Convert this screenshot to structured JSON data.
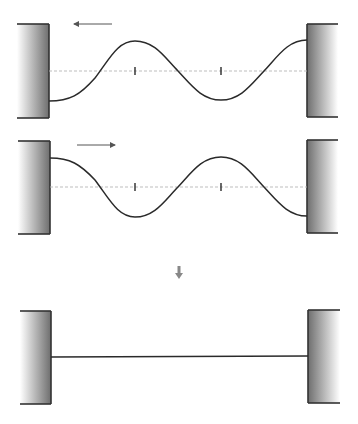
{
  "diagram": {
    "colors": {
      "wall_dark": "#6e6e6e",
      "wall_light": "#ffffff",
      "wall_border": "#333333",
      "wave": "#2a2a2a",
      "axis_dashed": "#b5b5b5",
      "arrow": "#555555",
      "down_arrow": "#888888"
    },
    "panels": [
      {
        "id": "wave-left-travel",
        "direction": "left",
        "arrow": {
          "x1": 112,
          "x2": 74,
          "y": 24
        },
        "left_wall": {
          "x": 17,
          "right": 49,
          "top": 24,
          "bottom": 118
        },
        "right_wall": {
          "x": 307,
          "right": 338,
          "top": 24,
          "bottom": 117
        },
        "axis_y": 71,
        "ticks_x": [
          135,
          221
        ],
        "wave_path": "M49,101 C70,101 80,95 95,78 C110,58 118,41 135,41 C155,41 165,58 178,71 C192,86 202,100 221,100 C240,100 250,86 264,71 C278,56 288,40 307,40"
      },
      {
        "id": "wave-right-travel",
        "direction": "right",
        "arrow": {
          "x1": 77,
          "x2": 115,
          "y": 145
        },
        "left_wall": {
          "x": 18,
          "right": 50,
          "top": 141,
          "bottom": 234
        },
        "right_wall": {
          "x": 307,
          "right": 338,
          "top": 140,
          "bottom": 233
        },
        "axis_y": 187,
        "ticks_x": [
          135,
          221
        ],
        "wave_path": "M50,158 C70,158 80,164 95,180 C110,200 118,217 135,217 C155,217 165,200 178,187 C192,172 202,157 221,157 C240,157 250,172 264,187 C278,202 288,216 307,216"
      },
      {
        "id": "superposition-flat",
        "direction": "none",
        "left_wall": {
          "x": 20,
          "right": 51,
          "top": 311,
          "bottom": 404
        },
        "right_wall": {
          "x": 308,
          "right": 340,
          "top": 310,
          "bottom": 403
        },
        "line": {
          "x1": 51,
          "y1": 357,
          "x2": 308,
          "y2": 356
        }
      }
    ],
    "down_arrow": {
      "x": 179,
      "y1": 266,
      "y2": 279
    }
  }
}
